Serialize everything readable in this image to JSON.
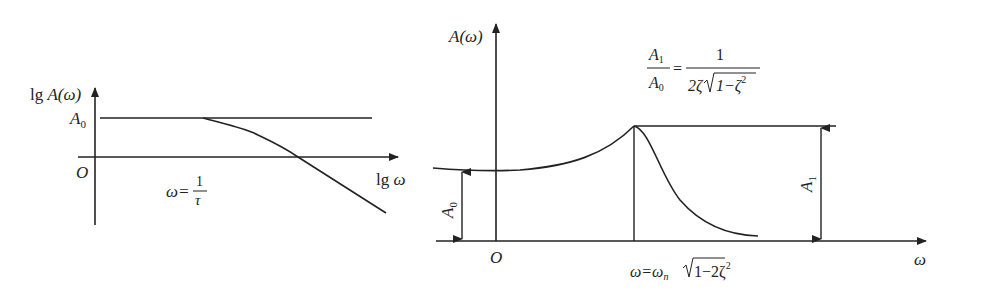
{
  "left_plot": {
    "y_axis_label_prefix": "lg ",
    "y_axis_label_var": "A(ω)",
    "x_axis_label_prefix": "lg ",
    "x_axis_label_var": "ω",
    "origin_label": "O",
    "level_label": "A",
    "level_sub": "0",
    "corner_label_lhs": "ω=",
    "corner_label_num": "1",
    "corner_label_den": "τ"
  },
  "right_plot": {
    "y_axis_label": "A(ω)",
    "x_axis_label": "ω",
    "origin_label": "O",
    "a0_label": "A",
    "a0_sub": "0",
    "a1_label": "A",
    "a1_sub": "1",
    "ratio_formula": {
      "lhs_num": "A",
      "lhs_num_sub": "1",
      "lhs_den": "A",
      "lhs_den_sub": "0",
      "eq": "=",
      "rhs_num": "1",
      "rhs_den_prefix": "2ζ",
      "rhs_den_sqrt": "1−ζ",
      "rhs_den_sup": "2"
    },
    "peak_label": {
      "lhs": "ω=ω",
      "sub": "n",
      "sqrt": "1−2ζ",
      "sup": "2"
    }
  },
  "colors": {
    "line": "#222222",
    "background": "#ffffff"
  }
}
